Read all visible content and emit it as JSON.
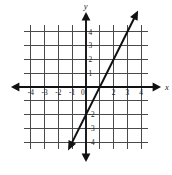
{
  "chart_data": {
    "type": "line",
    "title": "",
    "xlabel": "x",
    "ylabel": "y",
    "grid": true,
    "legend": null,
    "xlim": [
      -4.5,
      4.5
    ],
    "ylim": [
      -4.5,
      4.5
    ],
    "x_ticks": [
      -4,
      -3,
      -2,
      -1,
      0,
      2,
      3,
      4
    ],
    "y_ticks": [
      4,
      3,
      2,
      1,
      -2,
      -3,
      -4
    ],
    "x_tick_labels": [
      "-4",
      "-3",
      "-2",
      "-1",
      "0",
      "2",
      "3",
      "4"
    ],
    "y_tick_labels": [
      "4",
      "3",
      "2",
      "1",
      "-2",
      "-3",
      "-4"
    ],
    "origin_label": "0",
    "gridline_step": 1,
    "series": [
      {
        "name": "line",
        "equation": "y = 2x - 2",
        "slope": 2,
        "y_intercept": -2,
        "x_intercept": 1,
        "points": [
          [
            -1.3,
            -4.6
          ],
          [
            4.3,
            6.6
          ]
        ],
        "arrow_start": true,
        "arrow_end": true,
        "color": "#111111"
      }
    ],
    "axis_colors": {
      "grid": "#4a4a4a",
      "axis": "#111111",
      "line": "#111111"
    }
  },
  "axes": {
    "x_axis_label": "x",
    "y_axis_label": "y"
  },
  "ticks": {
    "x": [
      {
        "value": -4,
        "label": "-4"
      },
      {
        "value": -3,
        "label": "-3"
      },
      {
        "value": -2,
        "label": "-2"
      },
      {
        "value": -1,
        "label": "-1"
      },
      {
        "value": 0,
        "label": "0"
      },
      {
        "value": 2,
        "label": "2"
      },
      {
        "value": 3,
        "label": "3"
      },
      {
        "value": 4,
        "label": "4"
      }
    ],
    "y": [
      {
        "value": 4,
        "label": "4"
      },
      {
        "value": 3,
        "label": "3"
      },
      {
        "value": 2,
        "label": "2"
      },
      {
        "value": 1,
        "label": "1"
      },
      {
        "value": -2,
        "label": "-2"
      },
      {
        "value": -3,
        "label": "-3"
      },
      {
        "value": -4,
        "label": "-4"
      }
    ]
  }
}
